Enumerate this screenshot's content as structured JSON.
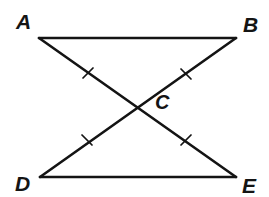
{
  "figure": {
    "kind": "geometry-diagram",
    "background_color": "#ffffff",
    "stroke_color": "#141414",
    "label_color": "#141414",
    "stroke_width": 2.6,
    "tick_stroke_width": 1.7
  },
  "points": [
    {
      "name": "A",
      "label": "A",
      "x": 39,
      "y": 38,
      "label_x": 16,
      "label_y": 11
    },
    {
      "name": "B",
      "label": "B",
      "x": 236,
      "y": 38,
      "label_x": 243,
      "label_y": 14
    },
    {
      "name": "C",
      "label": "C",
      "x": 137,
      "y": 108,
      "label_x": 155,
      "label_y": 92
    },
    {
      "name": "D",
      "label": "D",
      "x": 40,
      "y": 177,
      "label_x": 15,
      "label_y": 173
    },
    {
      "name": "E",
      "label": "E",
      "x": 236,
      "y": 177,
      "label_x": 242,
      "label_y": 175
    }
  ],
  "segments": [
    {
      "name": "segment-AB",
      "from": "A",
      "to": "B",
      "x1": 39,
      "y1": 38,
      "x2": 236,
      "y2": 38
    },
    {
      "name": "segment-DE",
      "from": "D",
      "to": "E",
      "x1": 40,
      "y1": 177,
      "x2": 236,
      "y2": 177
    },
    {
      "name": "segment-AE",
      "from": "A",
      "to": "E",
      "x1": 39,
      "y1": 38,
      "x2": 236,
      "y2": 177
    },
    {
      "name": "segment-DB",
      "from": "D",
      "to": "B",
      "x1": 40,
      "y1": 177,
      "x2": 236,
      "y2": 38
    }
  ],
  "tick_marks": [
    {
      "name": "tick-AC",
      "on_segment": "segment-AE",
      "cx": 88,
      "cy": 73,
      "x1": 83,
      "y1": 78,
      "x2": 93,
      "y2": 68
    },
    {
      "name": "tick-BC",
      "on_segment": "segment-DB",
      "cx": 186,
      "cy": 74,
      "x1": 181,
      "y1": 69,
      "x2": 191,
      "y2": 79
    },
    {
      "name": "tick-DC",
      "on_segment": "segment-DB",
      "cx": 87,
      "cy": 140,
      "x1": 82,
      "y1": 135,
      "x2": 92,
      "y2": 145
    },
    {
      "name": "tick-EC",
      "on_segment": "segment-AE",
      "cx": 186,
      "cy": 140,
      "x1": 181,
      "y1": 145,
      "x2": 191,
      "y2": 135
    }
  ]
}
